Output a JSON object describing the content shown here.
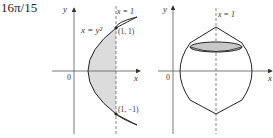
{
  "answer": "16π/15",
  "left_figure": {
    "y_axis_label": "y",
    "x_axis_label": "x",
    "origin_label": "0",
    "line_label": "x = 1",
    "curve_label": "x = y²",
    "point_top_label": "(1, 1)",
    "point_bottom_label": "(1, −1)"
  },
  "right_figure": {
    "y_axis_label": "y",
    "x_axis_label": "x",
    "origin_label": "0",
    "line_label": "x = 1"
  },
  "colors": {
    "shade": "#d9d9d9",
    "ink": "#333333",
    "ellipse": "#c8c8c8"
  }
}
